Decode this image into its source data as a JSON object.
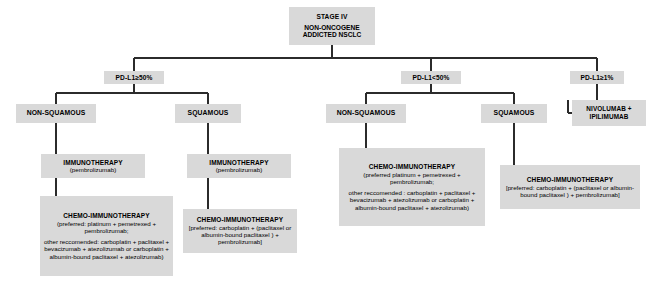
{
  "diagram": {
    "colors": {
      "node_fill": "#d9d9d9",
      "connector": "#2b2b2b",
      "text": "#000000",
      "background": "#ffffff"
    }
  },
  "root": {
    "line1": "STAGE IV",
    "line2": "NON-ONCOGENE",
    "line3": "ADDICTED NSCLC"
  },
  "biomarker_branches": [
    {
      "id": "pdl1-ge-50",
      "label": "PD-L1≥50%"
    },
    {
      "id": "pdl1-lt-50",
      "label": "PD-L1<50%"
    },
    {
      "id": "pdl1-ge-1",
      "label": "PD-L1≥1%"
    }
  ],
  "histology_nodes": [
    {
      "id": "non-squamous-high",
      "label": "NON-SQUAMOUS"
    },
    {
      "id": "squamous-high",
      "label": "SQUAMOUS"
    },
    {
      "id": "non-squamous-low",
      "label": "NON-SQUAMOUS"
    },
    {
      "id": "squamous-low",
      "label": "SQUAMOUS"
    }
  ],
  "nivo_ipi": {
    "line1": "NIVOLUMAB +",
    "line2": "IPILIMUMAB"
  },
  "treatments": {
    "t1": {
      "title": "IMMUNOTHERAPY",
      "detail": "(pembrolizumab)"
    },
    "t2": {
      "title": "CHEMO-IMMUNOTHERAPY",
      "detail1": "(preferred: platinum + pemetrexed + pembrolizumab;",
      "detail2": "other reccomended: carboplatin + paclitaxel + bevacizumab + atezolizumab or carboplatin + albumin-bound paclitaxel + atezolizumab)"
    },
    "t3": {
      "title": "IMMUNOTHERAPY",
      "detail": "(pembrolizumab)"
    },
    "t4": {
      "title": "CHEMO-IMMUNOTHERAPY",
      "detail": "[preferred: carboplatin + (paclitaxel or albumin-bound paclitaxel ) + pembrolizumab]"
    },
    "t5": {
      "title": "CHEMO-IMMUNOTHERAPY",
      "detail1": "(preferred platinum + pemetrexed + pembrolizumab;",
      "detail2": "other reccomended : carboplatin + paclitaxel + bevacizumab + atezolizumab or carboplatin + albumin-bound paclitaxel + atezolizumab)"
    },
    "t6": {
      "title": "CHEMO-IMMUNOTHERAPY",
      "detail": "[preferred: carboplatin + (paclitaxel or albumin-bound paclitaxel ) + pembrolizumab]"
    }
  }
}
